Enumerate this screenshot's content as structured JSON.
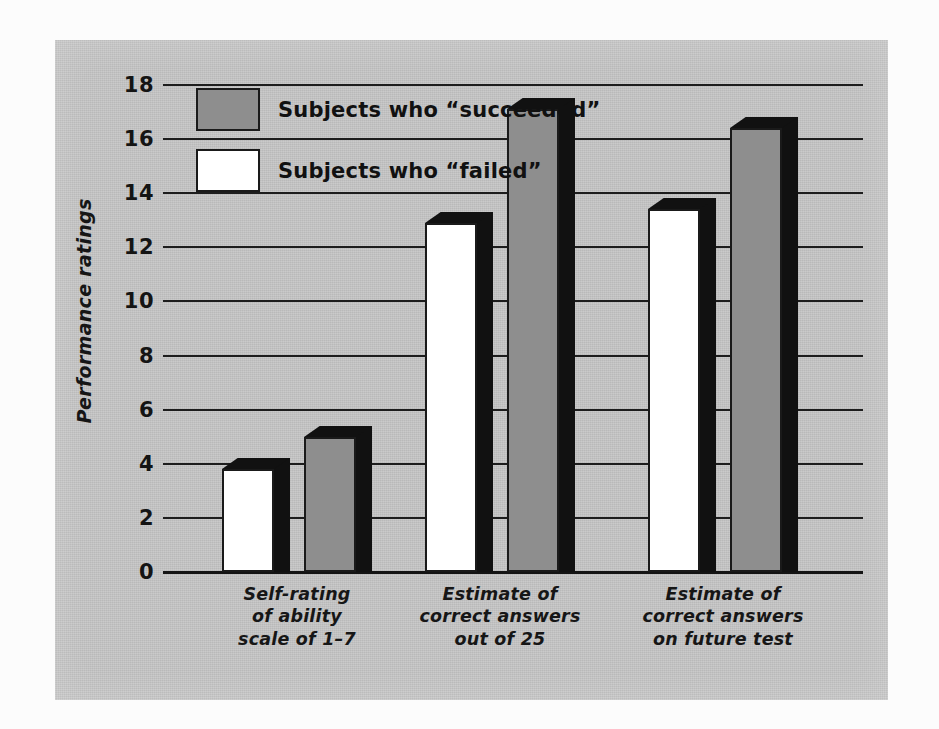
{
  "chart_data": {
    "type": "bar",
    "title": "",
    "subtitle": "",
    "xlabel": "",
    "ylabel": "Performance ratings",
    "categories": [
      "Self-rating\nof ability\nscale of 1–7",
      "Estimate of\ncorrect answers\nout of 25",
      "Estimate of\ncorrect answers\non future test"
    ],
    "category_lines": [
      [
        "Self-rating",
        "of ability",
        "scale of 1–7"
      ],
      [
        "Estimate of",
        "correct answers",
        "out of 25"
      ],
      [
        "Estimate of",
        "correct answers",
        "on future test"
      ]
    ],
    "series": [
      {
        "name": "Subjects who “failed”",
        "color": "#ffffff",
        "values": [
          3.8,
          12.9,
          13.4
        ]
      },
      {
        "name": "Subjects who “succeeded”",
        "color": "#8e8e8e",
        "values": [
          5.0,
          17.1,
          16.4
        ]
      }
    ],
    "ylim": [
      0,
      18
    ],
    "yticks": [
      0,
      2,
      4,
      6,
      8,
      10,
      12,
      14,
      16,
      18
    ],
    "ytick_labels": [
      "0",
      "2",
      "4",
      "6",
      "8",
      "10",
      "12",
      "14",
      "16",
      "18"
    ],
    "grid": true,
    "grid_axis": "y",
    "legend_position": "upper-left-inside",
    "bar_style": "3d-extruded",
    "panel_color": "#c6c6c6"
  },
  "legend": {
    "entries": [
      {
        "label": "Subjects who “succeeded”",
        "swatch": "gray"
      },
      {
        "label": "Subjects who “failed”",
        "swatch": "white"
      }
    ]
  },
  "axis": {
    "y_title": "Performance ratings",
    "y_ticks": [
      "18",
      "16",
      "14",
      "12",
      "10",
      "8",
      "6",
      "4",
      "2",
      "0"
    ]
  }
}
